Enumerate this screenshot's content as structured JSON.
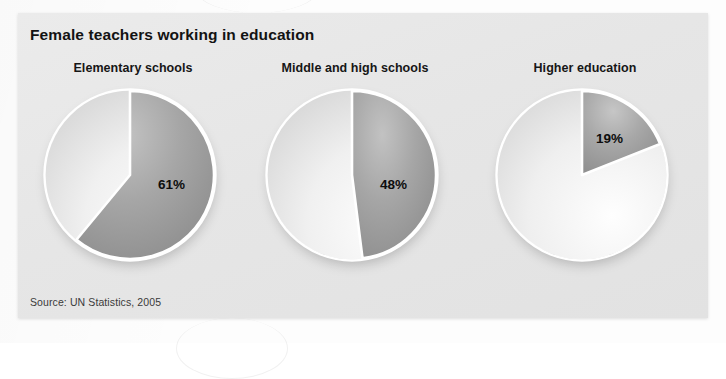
{
  "card": {
    "title": "Female teachers working in education",
    "source": "Source: UN Statistics, 2005",
    "background_color": "#e6e6e6",
    "title_color": "#131313"
  },
  "chart_data": {
    "type": "pie",
    "title": "Female teachers working in education",
    "subtitle": "",
    "xlabel": "",
    "ylabel": "",
    "annotations": [
      "Source: UN Statistics, 2005"
    ],
    "legend": "none",
    "grid": false,
    "note": "Three pie charts, each showing the share of teachers who are female in a given education level. Dark grey wedge = female share, light wedge = remainder.",
    "charts": [
      {
        "label": "Elementary schools",
        "slices": [
          {
            "name": "Female",
            "value": 61,
            "display": "61%",
            "color": "#9a9a9a"
          },
          {
            "name": "Other",
            "value": 39,
            "display": "",
            "color": "#f2f2f2"
          }
        ]
      },
      {
        "label": "Middle and high schools",
        "slices": [
          {
            "name": "Female",
            "value": 48,
            "display": "48%",
            "color": "#9a9a9a"
          },
          {
            "name": "Other",
            "value": 52,
            "display": "",
            "color": "#f2f2f2"
          }
        ]
      },
      {
        "label": "Higher education",
        "slices": [
          {
            "name": "Female",
            "value": 19,
            "display": "19%",
            "color": "#9a9a9a"
          },
          {
            "name": "Other",
            "value": 81,
            "display": "",
            "color": "#f2f2f2"
          }
        ]
      }
    ],
    "categories": [
      "Elementary schools",
      "Middle and high schools",
      "Higher education"
    ],
    "values": [
      61,
      48,
      19
    ],
    "value_labels": [
      "61%",
      "48%",
      "19%"
    ],
    "units": "percent"
  },
  "label_positions": [
    {
      "x": 118,
      "y": 92
    },
    {
      "x": 118,
      "y": 92
    },
    {
      "x": 104,
      "y": 46
    }
  ]
}
